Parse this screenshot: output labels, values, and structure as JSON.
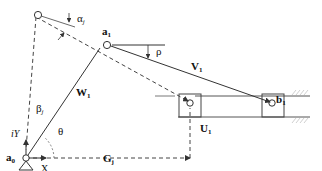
{
  "labels": {
    "a0": "a",
    "a0_sub": "0",
    "a1": "a",
    "a1_sub": "1",
    "b1": "b",
    "b1_sub": "1",
    "W1": "W",
    "W1_sub": "1",
    "V1": "V",
    "V1_sub": "1",
    "U1": "U",
    "U1_sub": "1",
    "Gj": "G",
    "Gj_sub": "j",
    "alpha_j": "α",
    "alpha_j_sub": "j",
    "beta_j": "β",
    "beta_j_sub": "j",
    "rho": "ρ",
    "theta": "θ",
    "iY": "iY",
    "X": "X"
  },
  "colors": {
    "line": "#333333",
    "dashed": "#444444",
    "hatch": "#bbbbbb"
  }
}
